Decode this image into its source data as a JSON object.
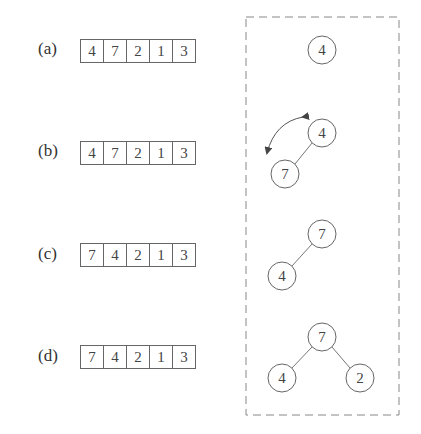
{
  "steps": [
    {
      "label": "(a)",
      "array": [
        "4",
        "7",
        "2",
        "1",
        "3"
      ],
      "tree": {
        "nodes": [
          {
            "value": "4",
            "x": 322,
            "y": 50
          }
        ],
        "edges": []
      }
    },
    {
      "label": "(b)",
      "array": [
        "4",
        "7",
        "2",
        "1",
        "3"
      ],
      "tree": {
        "nodes": [
          {
            "value": "4",
            "x": 322,
            "y": 133
          },
          {
            "value": "7",
            "x": 285,
            "y": 174
          }
        ],
        "edges": [
          [
            0,
            1
          ]
        ],
        "swap_arrow": true
      }
    },
    {
      "label": "(c)",
      "array": [
        "7",
        "4",
        "2",
        "1",
        "3"
      ],
      "tree": {
        "nodes": [
          {
            "value": "7",
            "x": 322,
            "y": 234
          },
          {
            "value": "4",
            "x": 282,
            "y": 276
          }
        ],
        "edges": [
          [
            0,
            1
          ]
        ]
      }
    },
    {
      "label": "(d)",
      "array": [
        "7",
        "4",
        "2",
        "1",
        "3"
      ],
      "tree": {
        "nodes": [
          {
            "value": "7",
            "x": 322,
            "y": 337
          },
          {
            "value": "4",
            "x": 282,
            "y": 378
          },
          {
            "value": "2",
            "x": 360,
            "y": 378
          }
        ],
        "edges": [
          [
            0,
            1
          ],
          [
            0,
            2
          ]
        ]
      }
    }
  ],
  "colors": {
    "stroke": "#666666",
    "text": "#444444",
    "dash": "#888888"
  }
}
